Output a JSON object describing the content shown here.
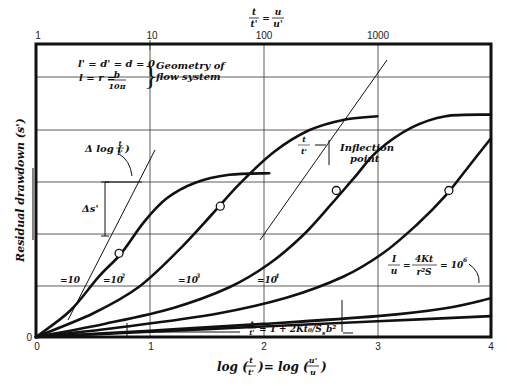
{
  "chart_data": {
    "type": "line",
    "title": "",
    "xlabel": "log (t/t') = log (u'/u)",
    "ylabel": "Residual drawdown (s')",
    "top_axis_label": "t/t' = u/u'",
    "xlim": [
      0,
      4
    ],
    "ylim": [
      0,
      5.6
    ],
    "grid": true,
    "x_ticks_bottom": [
      "0",
      "1",
      "2",
      "3",
      "4"
    ],
    "x_ticks_top": [
      "1",
      "10",
      "100",
      "1000"
    ],
    "y_ticks": [
      "0"
    ],
    "series": [
      {
        "name": "1/u0 = 10",
        "label": "=10",
        "points": [
          [
            0,
            0
          ],
          [
            0.3,
            0.5
          ],
          [
            0.55,
            1.15
          ],
          [
            0.75,
            1.6
          ],
          [
            0.95,
            2.2
          ],
          [
            1.15,
            2.65
          ],
          [
            1.4,
            2.95
          ],
          [
            1.7,
            3.1
          ],
          [
            2.05,
            3.13
          ]
        ],
        "inflection": [
          0.73,
          1.6
        ]
      },
      {
        "name": "1/u0 = 10^2",
        "label": "=10^2",
        "points": [
          [
            0,
            0
          ],
          [
            0.5,
            0.45
          ],
          [
            0.9,
            0.95
          ],
          [
            1.25,
            1.65
          ],
          [
            1.55,
            2.35
          ],
          [
            1.8,
            2.95
          ],
          [
            2.1,
            3.55
          ],
          [
            2.4,
            3.95
          ],
          [
            2.7,
            4.15
          ],
          [
            3.0,
            4.22
          ]
        ],
        "inflection": [
          1.62,
          2.5
        ]
      },
      {
        "name": "1/u0 = 10^3",
        "label": "=10^3",
        "points": [
          [
            0,
            0
          ],
          [
            0.6,
            0.25
          ],
          [
            1.2,
            0.55
          ],
          [
            1.7,
            0.95
          ],
          [
            2.05,
            1.4
          ],
          [
            2.35,
            1.95
          ],
          [
            2.6,
            2.55
          ],
          [
            2.8,
            3.05
          ],
          [
            3.0,
            3.55
          ],
          [
            3.3,
            4.0
          ],
          [
            3.6,
            4.22
          ],
          [
            4.0,
            4.25
          ]
        ],
        "inflection": [
          2.64,
          2.8
        ]
      },
      {
        "name": "1/u0 = 10^4",
        "label": "=10^4",
        "points": [
          [
            0,
            0
          ],
          [
            0.8,
            0.2
          ],
          [
            1.6,
            0.45
          ],
          [
            2.2,
            0.75
          ],
          [
            2.7,
            1.15
          ],
          [
            3.05,
            1.6
          ],
          [
            3.35,
            2.15
          ],
          [
            3.6,
            2.7
          ],
          [
            3.8,
            3.25
          ],
          [
            4.0,
            3.8
          ]
        ],
        "inflection": [
          3.63,
          2.8
        ]
      },
      {
        "name": "1/u0 = 10^6",
        "label": "1/u0 = 4Kt0/r^2 Ss = 10^6",
        "points": [
          [
            0,
            0
          ],
          [
            1,
            0.12
          ],
          [
            2,
            0.25
          ],
          [
            3,
            0.4
          ],
          [
            3.6,
            0.55
          ],
          [
            4.0,
            0.74
          ]
        ]
      },
      {
        "name": "t/t' = 1 + 2Kt0/Ssb^2 asymptote",
        "points": [
          [
            0,
            0
          ],
          [
            1,
            0.1
          ],
          [
            2,
            0.2
          ],
          [
            3,
            0.3
          ],
          [
            4,
            0.4
          ]
        ]
      }
    ],
    "annotations": {
      "geometry_line1": "l' = d' = d = 0",
      "geometry_line2_prefix": "l = r =",
      "geometry_frac_num": "b",
      "geometry_frac_den": "10π",
      "geometry_label1": "Geometry of",
      "geometry_label2": "flow system",
      "delta_log_prefix": "Δ log (",
      "delta_log_num": "t",
      "delta_log_den": "t'",
      "delta_log_suffix": ")",
      "delta_s": "Δs'",
      "inflection_num": "t",
      "inflection_num_sub": "i",
      "inflection_den": "t'",
      "inflection_den_sub": "i",
      "inflection_label1": "Inflection",
      "inflection_label2": "point",
      "label_10": "=10",
      "label_10_2": "=10",
      "label_10_3": "=10",
      "label_10_4": "=10",
      "sup_2": "2",
      "sup_3": "3",
      "sup_4": "4",
      "u0_num": "I",
      "u0_den": "u",
      "u0_den_sub": "0",
      "u0_eq": "=",
      "u0_rhs_num": "4Kt",
      "u0_rhs_num_sub": "0",
      "u0_rhs_den": "r²S",
      "u0_rhs_den_sub": "s",
      "u0_value": "= 10",
      "u0_value_sup": "6",
      "asym_num": "t",
      "asym_den": "t'",
      "asym_rhs": "= 1 + 2Kt₀/S",
      "asym_rhs2": "b²",
      "asym_sub": "s",
      "xlabel_prefix": "log (",
      "xlabel_mid": ")= log (",
      "xlabel_suffix": ")",
      "xlabel_n1": "t",
      "xlabel_d1": "t'",
      "xlabel_n2": "u'",
      "xlabel_d2": "u",
      "top_n1": "t",
      "top_d1": "t'",
      "top_eq": "=",
      "top_n2": "u",
      "top_d2": "u'"
    }
  }
}
